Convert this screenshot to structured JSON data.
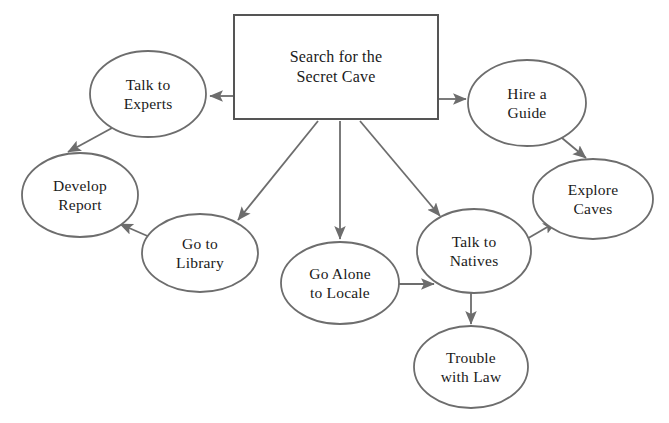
{
  "diagram": {
    "type": "flow-map",
    "colors": {
      "background": "#ffffff",
      "stroke": "#6d6d6d",
      "root_stroke": "#555555",
      "text": "#1a1a1a"
    },
    "nodes": [
      {
        "id": "root",
        "shape": "rectangle",
        "line1": "Search for the",
        "line2": "Secret Cave",
        "cx": 336,
        "cy": 67,
        "rx": 102,
        "ry": 52
      },
      {
        "id": "talk-to-experts",
        "shape": "ellipse",
        "line1": "Talk to",
        "line2": "Experts",
        "cx": 148,
        "cy": 94,
        "rx": 58,
        "ry": 43
      },
      {
        "id": "hire-a-guide",
        "shape": "ellipse",
        "line1": "Hire a",
        "line2": "Guide",
        "cx": 527,
        "cy": 103,
        "rx": 59,
        "ry": 43
      },
      {
        "id": "develop-report",
        "shape": "ellipse",
        "line1": "Develop",
        "line2": "Report",
        "cx": 80,
        "cy": 195,
        "rx": 58,
        "ry": 42
      },
      {
        "id": "explore-caves",
        "shape": "ellipse",
        "line1": "Explore",
        "line2": "Caves",
        "cx": 593,
        "cy": 199,
        "rx": 60,
        "ry": 40
      },
      {
        "id": "go-to-library",
        "shape": "ellipse",
        "line1": "Go to",
        "line2": "Library",
        "cx": 200,
        "cy": 253,
        "rx": 58,
        "ry": 39
      },
      {
        "id": "talk-to-natives",
        "shape": "ellipse",
        "line1": "Talk to",
        "line2": "Natives",
        "cx": 474,
        "cy": 251,
        "rx": 57,
        "ry": 42
      },
      {
        "id": "go-alone-to-locale",
        "shape": "ellipse",
        "line1": "Go Alone",
        "line2": "to Locale",
        "cx": 340,
        "cy": 283,
        "rx": 59,
        "ry": 41
      },
      {
        "id": "trouble-with-law",
        "shape": "ellipse",
        "line1": "Trouble",
        "line2": "with Law",
        "cx": 471,
        "cy": 367,
        "rx": 57,
        "ry": 41
      }
    ],
    "edges": [
      {
        "id": "root-to-talk-to-experts",
        "from": "root",
        "to": "talk-to-experts",
        "x1": 234,
        "y1": 96,
        "x2": 210,
        "y2": 96
      },
      {
        "id": "root-to-hire-a-guide",
        "from": "root",
        "to": "hire-a-guide",
        "x1": 438,
        "y1": 99,
        "x2": 466,
        "y2": 99
      },
      {
        "id": "root-to-go-to-library",
        "from": "root",
        "to": "go-to-library",
        "x1": 318,
        "y1": 121,
        "x2": 238,
        "y2": 220
      },
      {
        "id": "root-to-go-alone-to-locale",
        "from": "root",
        "to": "go-alone-to-locale",
        "x1": 340,
        "y1": 121,
        "x2": 340,
        "y2": 239
      },
      {
        "id": "root-to-talk-to-natives",
        "from": "root",
        "to": "talk-to-natives",
        "x1": 360,
        "y1": 121,
        "x2": 440,
        "y2": 216
      },
      {
        "id": "talk-to-experts-to-develop-report",
        "from": "talk-to-experts",
        "to": "develop-report",
        "x1": 112,
        "y1": 128,
        "x2": 68,
        "y2": 152
      },
      {
        "id": "go-to-library-to-develop-report",
        "from": "go-to-library",
        "to": "develop-report",
        "x1": 152,
        "y1": 238,
        "x2": 120,
        "y2": 224
      },
      {
        "id": "hire-a-guide-to-explore-caves",
        "from": "hire-a-guide",
        "to": "explore-caves",
        "x1": 556,
        "y1": 133,
        "x2": 586,
        "y2": 158
      },
      {
        "id": "go-alone-to-locale-to-talk-to-natives",
        "from": "go-alone-to-locale",
        "to": "talk-to-natives",
        "x1": 399,
        "y1": 284,
        "x2": 434,
        "y2": 284
      },
      {
        "id": "talk-to-natives-to-explore-caves",
        "from": "talk-to-natives",
        "to": "explore-caves",
        "x1": 525,
        "y1": 240,
        "x2": 556,
        "y2": 222
      },
      {
        "id": "talk-to-natives-to-trouble-with-law",
        "from": "talk-to-natives",
        "to": "trouble-with-law",
        "x1": 471,
        "y1": 293,
        "x2": 471,
        "y2": 324
      }
    ]
  }
}
